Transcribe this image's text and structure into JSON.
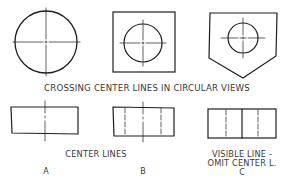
{
  "colors": {
    "background": "#ffffff",
    "stroke": "#1e1e1e",
    "text": "#3a3a3a"
  },
  "top_row": {
    "caption": "CROSSING CENTER LINES IN CIRCULAR VIEWS",
    "views": [
      {
        "id": "circle-view",
        "shape": "circle",
        "center_lines": "crossing"
      },
      {
        "id": "square-with-circle-view",
        "shape": "square with inner circle",
        "center_lines": "crossing"
      },
      {
        "id": "pentagon-with-circle-view",
        "shape": "pointed pentagon with inner circle",
        "center_lines": "crossing"
      }
    ]
  },
  "bottom_row": {
    "views": [
      {
        "id": "A",
        "letter": "A",
        "label_lines": [
          "CENTER LINES"
        ],
        "description": "rectangle with one vertical center line"
      },
      {
        "id": "B",
        "letter": "B",
        "label_lines": [],
        "description": "rectangle with three dashed vertical lines"
      },
      {
        "id": "C",
        "letter": "C",
        "label_lines": [
          "VISIBLE LINE -",
          "OMIT CENTER L."
        ],
        "description": "rectangle with solid center visible line and two hidden lines"
      }
    ]
  }
}
